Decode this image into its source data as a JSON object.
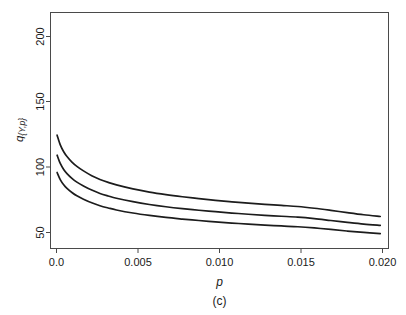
{
  "chart_data": {
    "type": "line",
    "title": "",
    "subtitle": "",
    "caption": "(c)",
    "xlabel": "p",
    "ylabel": "q_{Y,p}",
    "ylabel_parts": {
      "base": "q",
      "subscript": "{Y,p}"
    },
    "xlim": [
      0.0,
      0.0205
    ],
    "ylim": [
      38,
      215
    ],
    "grid": false,
    "legend": "none",
    "xticks": [
      0.0,
      0.005,
      0.01,
      0.015,
      0.02
    ],
    "xticklabels": [
      "0.0",
      "0.005",
      "0.010",
      "0.015",
      "0.020"
    ],
    "yticks": [
      50,
      100,
      150,
      200
    ],
    "yticklabels": [
      "50",
      "100",
      "150",
      "200"
    ],
    "x": [
      0.0004,
      0.0006,
      0.0008,
      0.001,
      0.0013,
      0.0016,
      0.002,
      0.0025,
      0.003,
      0.0035,
      0.004,
      0.005,
      0.006,
      0.007,
      0.008,
      0.009,
      0.01,
      0.011,
      0.012,
      0.013,
      0.014,
      0.015,
      0.016,
      0.017,
      0.018,
      0.019,
      0.02
    ],
    "series": [
      {
        "name": "upper",
        "values": [
          123.0,
          115.5,
          110.6,
          107.0,
          102.8,
          99.6,
          96.2,
          92.6,
          89.8,
          87.6,
          85.7,
          82.7,
          80.3,
          78.4,
          76.8,
          75.4,
          74.1,
          73.0,
          72.0,
          71.1,
          70.3,
          69.5,
          68.2,
          66.6,
          64.9,
          63.3,
          62.0
        ]
      },
      {
        "name": "middle",
        "values": [
          108.0,
          101.6,
          97.3,
          94.2,
          90.6,
          87.8,
          84.9,
          81.8,
          79.3,
          77.4,
          75.7,
          73.1,
          71.0,
          69.3,
          67.9,
          66.7,
          65.6,
          64.6,
          63.7,
          62.9,
          62.2,
          61.5,
          60.4,
          59.0,
          57.6,
          56.3,
          55.3
        ]
      },
      {
        "name": "lower",
        "values": [
          95.0,
          89.5,
          85.8,
          83.1,
          80.0,
          77.5,
          75.0,
          72.3,
          70.1,
          68.4,
          66.9,
          64.6,
          62.8,
          61.3,
          60.1,
          59.0,
          58.0,
          57.1,
          56.3,
          55.6,
          54.9,
          54.3,
          53.4,
          52.3,
          51.1,
          50.1,
          49.2
        ]
      }
    ],
    "colors": {
      "curve": "#1c1c1c",
      "axis": "#4a4a4a",
      "text": "#1a1a1a",
      "background": "#ffffff"
    }
  }
}
